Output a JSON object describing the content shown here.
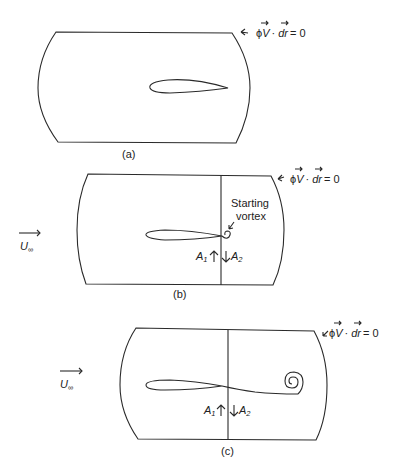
{
  "panels": [
    {
      "id": "a",
      "caption": "(a)",
      "contour_label": {
        "phi": "ϕ",
        "V": "V",
        "dot": "·",
        "dr": "dr",
        "eq": "= 0"
      }
    },
    {
      "id": "b",
      "caption": "(b)",
      "contour_label": {
        "phi": "ϕ",
        "V": "V",
        "dot": "·",
        "dr": "dr",
        "eq": "= 0"
      },
      "freestream": {
        "U": "U",
        "sub": "∞"
      },
      "vortex_label_line1": "Starting",
      "vortex_label_line2": "vortex",
      "areas": {
        "A1": "A",
        "A1_sub": "1",
        "A2": "A",
        "A2_sub": "2"
      }
    },
    {
      "id": "c",
      "caption": "(c)",
      "contour_label": {
        "phi": "ϕ",
        "V": "V",
        "dot": "·",
        "dr": "dr",
        "eq": "= 0"
      },
      "freestream": {
        "U": "U",
        "sub": "∞"
      },
      "areas": {
        "A1": "A",
        "A1_sub": "1",
        "A2": "A",
        "A2_sub": "2"
      }
    }
  ],
  "colors": {
    "line": "#2a2a2a",
    "background": "#ffffff"
  }
}
